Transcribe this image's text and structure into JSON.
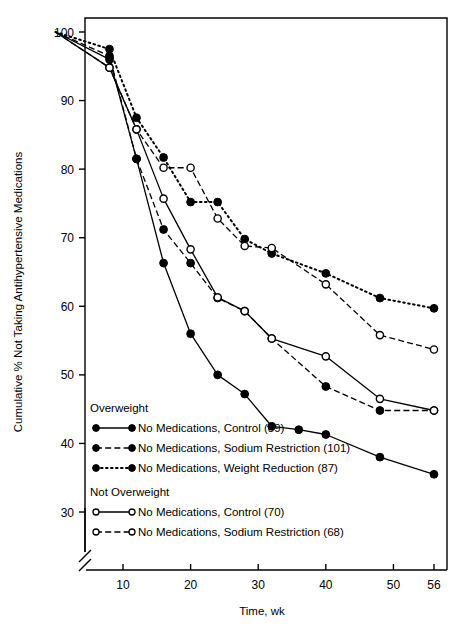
{
  "chart_data": {
    "type": "line",
    "title": "",
    "xlabel": "Time, wk",
    "ylabel": "Cumulative % Not Taking Antihypertensive Medications",
    "xlim": [
      0,
      58
    ],
    "ylim": [
      28,
      101
    ],
    "xticks": [
      10,
      20,
      30,
      40,
      50,
      56
    ],
    "yticks": [
      30,
      40,
      50,
      60,
      70,
      80,
      90,
      100
    ],
    "grid": false,
    "axis_break_y": true,
    "legend_position": "inside-lower-left",
    "legend_groups": [
      {
        "heading": "Overweight",
        "entries": [
          {
            "label": "No Medications, Control (89)",
            "marker": "filled-circle",
            "line": "solid",
            "series": "ow_control"
          },
          {
            "label": "No Medications, Sodium Restriction (101)",
            "marker": "filled-circle",
            "line": "dashed",
            "series": "ow_sodium"
          },
          {
            "label": "No Medications, Weight Reduction (87)",
            "marker": "filled-circle",
            "line": "dotted",
            "series": "ow_weight"
          }
        ]
      },
      {
        "heading": "Not Overweight",
        "entries": [
          {
            "label": "No Medications, Control (70)",
            "marker": "open-circle",
            "line": "solid",
            "series": "now_control"
          },
          {
            "label": "No Medications, Sodium Restriction (68)",
            "marker": "open-circle",
            "line": "dashed",
            "series": "now_sodium"
          }
        ]
      }
    ],
    "series": [
      {
        "name": "No Medications, Control (89)",
        "key": "ow_control",
        "group": "Overweight",
        "marker": "filled-circle",
        "line": "solid",
        "n": 89,
        "x": [
          0,
          8,
          12,
          16,
          20,
          24,
          28,
          32,
          36,
          40,
          48,
          56
        ],
        "y": [
          100.0,
          96.0,
          81.5,
          66.3,
          56.0,
          50.0,
          47.2,
          42.5,
          42.0,
          41.3,
          38.0,
          35.5
        ]
      },
      {
        "name": "No Medications, Sodium Restriction (101)",
        "key": "ow_sodium",
        "group": "Overweight",
        "marker": "filled-circle",
        "line": "dashed",
        "n": 101,
        "x": [
          0,
          8,
          12,
          16,
          20,
          24,
          28,
          32,
          40,
          48,
          56
        ],
        "y": [
          100.0,
          96.5,
          81.5,
          71.2,
          66.3,
          61.2,
          59.3,
          55.3,
          48.3,
          44.8,
          44.8
        ]
      },
      {
        "name": "No Medications, Weight Reduction (87)",
        "key": "ow_weight",
        "group": "Overweight",
        "marker": "filled-circle",
        "line": "dotted",
        "n": 87,
        "x": [
          0,
          8,
          12,
          16,
          20,
          24,
          28,
          32,
          40,
          48,
          56
        ],
        "y": [
          100.0,
          97.5,
          87.5,
          81.7,
          75.2,
          75.2,
          69.8,
          67.7,
          64.8,
          61.2,
          59.7
        ]
      },
      {
        "name": "No Medications, Control (70)",
        "key": "now_control",
        "group": "Not Overweight",
        "marker": "open-circle",
        "line": "solid",
        "n": 70,
        "x": [
          0,
          8,
          12,
          16,
          20,
          24,
          28,
          32,
          40,
          48,
          56
        ],
        "y": [
          100.0,
          94.8,
          85.8,
          75.7,
          68.3,
          61.3,
          59.3,
          55.3,
          52.7,
          46.5,
          44.8
        ]
      },
      {
        "name": "No Medications, Sodium Restriction (68)",
        "key": "now_sodium",
        "group": "Not Overweight",
        "marker": "open-circle",
        "line": "dashed",
        "n": 68,
        "x": [
          0,
          8,
          12,
          16,
          20,
          24,
          28,
          32,
          40,
          48,
          56
        ],
        "y": [
          100.0,
          94.8,
          85.8,
          80.2,
          80.2,
          72.8,
          68.8,
          68.5,
          63.2,
          55.8,
          53.7
        ]
      }
    ]
  },
  "colors": {
    "foreground": "#000000",
    "background": "#ffffff"
  }
}
